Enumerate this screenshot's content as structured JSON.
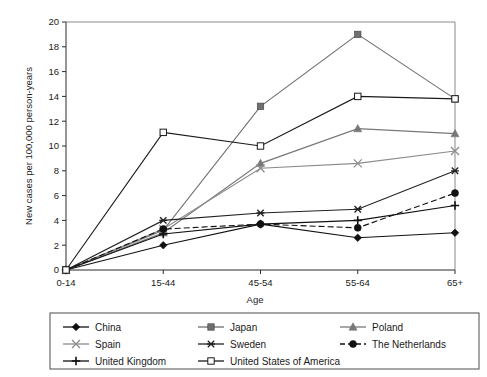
{
  "chart_data": {
    "type": "line",
    "title": "",
    "xlabel": "Age",
    "ylabel": "New cases per 100,000 person-years",
    "categories": [
      "0-14",
      "15-44",
      "45-54",
      "55-64",
      "65+"
    ],
    "ylim": [
      0,
      20
    ],
    "ytick_step": 2,
    "yticks": [
      "0",
      "2",
      "4",
      "6",
      "8",
      "10",
      "12",
      "14",
      "16",
      "18",
      "20"
    ],
    "grid": false,
    "legend_position": "bottom",
    "series": [
      {
        "name": "China",
        "marker": "filled-diamond",
        "color": "#111111",
        "dash": "none",
        "values": [
          0,
          2.0,
          3.7,
          2.6,
          3.0
        ]
      },
      {
        "name": "Japan",
        "marker": "filled-square",
        "color": "#6f6f6f",
        "dash": "none",
        "values": [
          0,
          3.2,
          13.2,
          19.0,
          13.8
        ]
      },
      {
        "name": "Poland",
        "marker": "filled-triangle",
        "color": "#777777",
        "dash": "none",
        "values": [
          0,
          3.0,
          8.6,
          11.4,
          11.0
        ]
      },
      {
        "name": "Spain",
        "marker": "cross-x",
        "color": "#8c8c8c",
        "dash": "none",
        "values": [
          0,
          3.3,
          8.2,
          8.6,
          9.6
        ]
      },
      {
        "name": "Sweden",
        "marker": "asterisk",
        "color": "#222222",
        "dash": "none",
        "values": [
          0,
          4.0,
          4.6,
          4.9,
          8.0
        ]
      },
      {
        "name": "The Netherlands",
        "marker": "filled-circle",
        "color": "#111111",
        "dash": "dashed",
        "values": [
          0,
          3.3,
          3.7,
          3.4,
          6.2
        ]
      },
      {
        "name": "United Kingdom",
        "marker": "plus",
        "color": "#111111",
        "dash": "none",
        "values": [
          0,
          2.9,
          3.7,
          4.0,
          5.2
        ]
      },
      {
        "name": "United States of America",
        "marker": "open-square",
        "color": "#1a1a1a",
        "dash": "none",
        "values": [
          0,
          11.1,
          10.0,
          14.0,
          13.8
        ]
      }
    ]
  },
  "legend": {
    "entries": [
      "China",
      "Japan",
      "Poland",
      "Spain",
      "Sweden",
      "The Netherlands",
      "United Kingdom",
      "United States of America"
    ]
  }
}
